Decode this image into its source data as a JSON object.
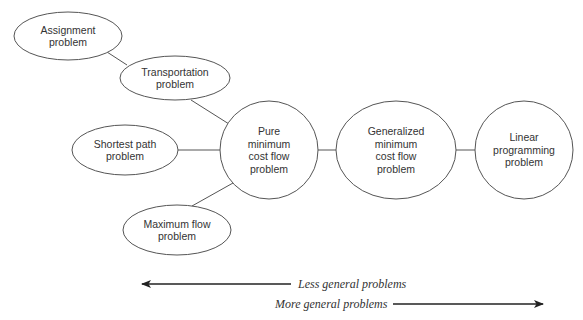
{
  "diagram": {
    "nodes": [
      {
        "id": "assignment",
        "lines": [
          "Assignment",
          "problem"
        ],
        "shape": "ellipse",
        "cx": 68,
        "cy": 36,
        "rx": 54,
        "ry": 24
      },
      {
        "id": "transportation",
        "lines": [
          "Transportation",
          "problem"
        ],
        "shape": "ellipse",
        "cx": 175,
        "cy": 78,
        "rx": 55,
        "ry": 22
      },
      {
        "id": "shortest_path",
        "lines": [
          "Shortest path",
          "problem"
        ],
        "shape": "ellipse",
        "cx": 125,
        "cy": 150,
        "rx": 53,
        "ry": 25
      },
      {
        "id": "maximum_flow",
        "lines": [
          "Maximum flow",
          "problem"
        ],
        "shape": "ellipse",
        "cx": 177,
        "cy": 230,
        "rx": 54,
        "ry": 25
      },
      {
        "id": "pure_min_cost_flow",
        "lines": [
          "Pure",
          "minimum",
          "cost flow",
          "problem"
        ],
        "shape": "circle",
        "cx": 269,
        "cy": 150,
        "rx": 49,
        "ry": 49
      },
      {
        "id": "generalized_min_cost_flow",
        "lines": [
          "Generalized",
          "minimum",
          "cost flow",
          "problem"
        ],
        "shape": "ellipse",
        "cx": 396,
        "cy": 150,
        "rx": 60,
        "ry": 49
      },
      {
        "id": "linear_programming",
        "lines": [
          "Linear",
          "programming",
          "problem"
        ],
        "shape": "circle",
        "cx": 524,
        "cy": 150,
        "rx": 49,
        "ry": 49
      }
    ],
    "edges": [
      {
        "from": "assignment",
        "to": "transportation",
        "x1": 107,
        "y1": 52,
        "x2": 127,
        "y2": 65
      },
      {
        "from": "transportation",
        "to": "pure_min_cost_flow",
        "x1": 191,
        "y1": 100,
        "x2": 229,
        "y2": 124
      },
      {
        "from": "shortest_path",
        "to": "pure_min_cost_flow",
        "x1": 178,
        "y1": 150,
        "x2": 220,
        "y2": 150
      },
      {
        "from": "maximum_flow",
        "to": "pure_min_cost_flow",
        "x1": 192,
        "y1": 206,
        "x2": 233,
        "y2": 183
      },
      {
        "from": "pure_min_cost_flow",
        "to": "generalized_min_cost_flow",
        "x1": 318,
        "y1": 150,
        "x2": 336,
        "y2": 150
      },
      {
        "from": "generalized_min_cost_flow",
        "to": "linear_programming",
        "x1": 456,
        "y1": 150,
        "x2": 475,
        "y2": 150
      }
    ],
    "scale_arrows": {
      "less_general": {
        "label": "Less general problems",
        "direction": "left",
        "x1": 142,
        "x2": 291,
        "y": 284,
        "text_x": 298
      },
      "more_general": {
        "label": "More general problems",
        "direction": "right",
        "x1": 393,
        "x2": 543,
        "y": 304,
        "text_x": 275
      }
    }
  }
}
